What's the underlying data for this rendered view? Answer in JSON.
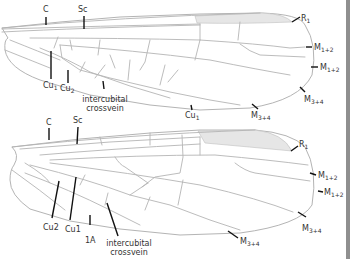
{
  "figure": {
    "wings": [
      {
        "name": "upper-wing",
        "labels": {
          "c": "C",
          "sc": "Sc",
          "r1": {
            "base": "R",
            "sub": "1"
          },
          "m12a": {
            "base": "M",
            "sub": "1+2"
          },
          "m12b": {
            "base": "M",
            "sub": "1+2"
          },
          "m34a": {
            "base": "M",
            "sub": "3+4"
          },
          "m34b": {
            "base": "M",
            "sub": "3+4"
          },
          "cu1a": {
            "base": "Cu",
            "sub": "1"
          },
          "cu1b": {
            "base": "Cu",
            "sub": "1"
          },
          "cu2": {
            "base": "Cu",
            "sub": "2"
          },
          "intercubital_line1": "intercubital",
          "intercubital_line2": "crossvein"
        }
      },
      {
        "name": "lower-wing",
        "labels": {
          "c": "C",
          "sc": "Sc",
          "r1": {
            "base": "R",
            "sub": "1"
          },
          "m12a": {
            "base": "M",
            "sub": "1+2"
          },
          "m12b": {
            "base": "M",
            "sub": "1+2"
          },
          "m34a": {
            "base": "M",
            "sub": "3+4"
          },
          "m34b": {
            "base": "M",
            "sub": "3+4"
          },
          "cu2": "Cu2",
          "cu1": "Cu1",
          "a1": "1A",
          "intercubital_line1": "intercubital",
          "intercubital_line2": "crossvein"
        }
      }
    ],
    "colors": {
      "vein": "#b4b4b4",
      "stigma": "#e6e6e6",
      "leader": "#111111",
      "text": "#333333",
      "side_strip": "#8f8f8f"
    }
  }
}
